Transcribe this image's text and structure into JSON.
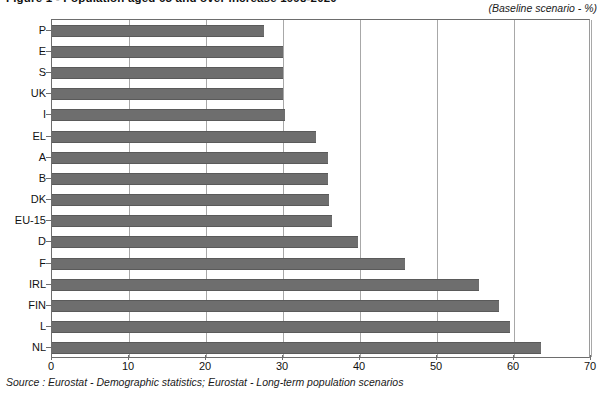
{
  "figure": {
    "title": "Figure 1 - Population aged 65 and over increase 1998-2020",
    "baseline_caption": "(Baseline scenario - %)",
    "source_note": "Source : Eurostat - Demographic statistics; Eurostat - Long-term population scenarios"
  },
  "chart_data": {
    "type": "bar",
    "orientation": "horizontal",
    "title": "Figure 1 - Population aged 65 and over increase 1998-2020",
    "subtitle": "(Baseline scenario - %)",
    "xlabel": "",
    "ylabel": "",
    "xlim": [
      0,
      70
    ],
    "ylim": null,
    "grid": true,
    "legend": false,
    "bar_color": "#6e6e6e",
    "categories": [
      "P",
      "E",
      "S",
      "UK",
      "I",
      "EL",
      "A",
      "B",
      "DK",
      "EU-15",
      "D",
      "F",
      "IRL",
      "FIN",
      "L",
      "NL"
    ],
    "values": [
      27.5,
      30.0,
      30.0,
      30.0,
      30.2,
      34.3,
      35.8,
      35.8,
      36.0,
      36.3,
      39.8,
      45.8,
      55.5,
      58.0,
      59.5,
      63.5
    ],
    "xticks": [
      0,
      10,
      20,
      30,
      40,
      50,
      60,
      70
    ],
    "xtick_labels": [
      "0",
      "10",
      "20",
      "30",
      "40",
      "50",
      "60",
      "70"
    ]
  }
}
